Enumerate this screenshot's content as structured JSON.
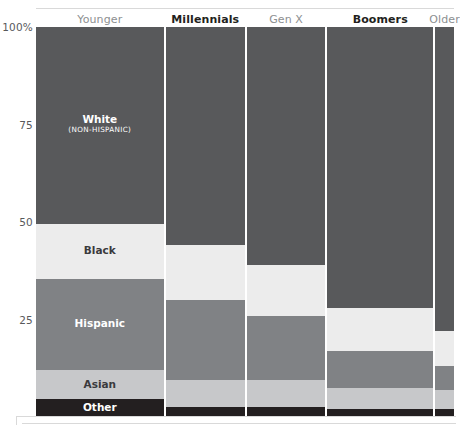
{
  "chart_data": {
    "type": "bar",
    "subtype": "marimekko-stacked-100pct",
    "title": "",
    "xlabel": "",
    "ylabel": "",
    "ylim": [
      0,
      100
    ],
    "y_unit": "%",
    "grid": false,
    "legend_position": "in-plot-labels",
    "categories": [
      "Younger",
      "Millennials",
      "Gen X",
      "Boomers",
      "Older"
    ],
    "category_widths_pct": [
      30.6,
      19.0,
      18.8,
      25.4,
      4.5
    ],
    "series": [
      {
        "name": "White",
        "sublabel": "(NON-HISPANIC)",
        "color": "#58595b",
        "text_color": "#ffffff",
        "values": [
          50.5,
          56.0,
          61.0,
          72.0,
          78.0
        ]
      },
      {
        "name": "Black",
        "color": "#ececec",
        "text_color": "#3a3a3c",
        "values": [
          14.0,
          14.0,
          13.0,
          11.0,
          9.0
        ]
      },
      {
        "name": "Hispanic",
        "color": "#808285",
        "text_color": "#ffffff",
        "values": [
          23.5,
          20.5,
          16.5,
          9.5,
          6.0
        ]
      },
      {
        "name": "Asian",
        "color": "#c7c8ca",
        "text_color": "#3a3a3c",
        "values": [
          7.5,
          7.0,
          7.0,
          5.5,
          5.0
        ]
      },
      {
        "name": "Other",
        "color": "#231f20",
        "text_color": "#ffffff",
        "values": [
          4.5,
          2.5,
          2.5,
          2.0,
          2.0
        ]
      }
    ],
    "y_ticks": [
      {
        "label": "100%",
        "value": 100
      },
      {
        "label": "75",
        "value": 75
      },
      {
        "label": "50",
        "value": 50
      },
      {
        "label": "25",
        "value": 25
      }
    ]
  },
  "axis": {
    "ticks": [
      "100%",
      "75",
      "50",
      "25"
    ]
  },
  "columns": {
    "headers": [
      {
        "label": "Younger",
        "emphasis": "normal"
      },
      {
        "label": "Millennials",
        "emphasis": "strong"
      },
      {
        "label": "Gen X",
        "emphasis": "normal"
      },
      {
        "label": "Boomers",
        "emphasis": "strong"
      },
      {
        "label": "Older",
        "emphasis": "normal"
      }
    ]
  },
  "labels": {
    "white": "White",
    "white_sub": "(NON-HISPANIC)",
    "black": "Black",
    "hispanic": "Hispanic",
    "asian": "Asian",
    "other": "Other"
  },
  "colors": {
    "white_seg": "#58595b",
    "black_seg": "#ececec",
    "hispanic_seg": "#808285",
    "asian_seg": "#c7c8ca",
    "other_seg": "#231f20",
    "axis_text": "#58595b",
    "header_muted": "#8d8f91",
    "header_strong": "#231f20",
    "rule": "#d9d9d9",
    "background": "#ffffff"
  }
}
